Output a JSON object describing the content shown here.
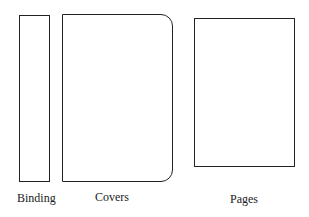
{
  "diagram": {
    "parts": [
      {
        "id": "binding",
        "label": "Binding"
      },
      {
        "id": "covers",
        "label": "Covers"
      },
      {
        "id": "pages",
        "label": "Pages"
      }
    ],
    "stroke_color": "#222222"
  }
}
